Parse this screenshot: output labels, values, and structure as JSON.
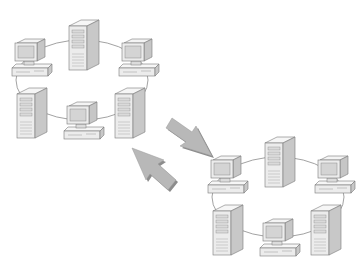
{
  "diagram": {
    "type": "network-ring-exchange",
    "colors": {
      "background": "#ffffff",
      "line": "#8a8a8a",
      "device_fill": "#ececec",
      "device_side": "#c8c8c8",
      "device_top": "#f6f6f6",
      "device_stroke": "#7a7a7a",
      "screen": "#d4d4d4",
      "arrow_fill": "#b8b8b8",
      "arrow_shadow": "#8c8c8c"
    },
    "networks": [
      {
        "id": "network-a",
        "position": "top-left",
        "offset": [
          0,
          0
        ],
        "topology": "ring",
        "nodes": [
          {
            "kind": "workstation",
            "slot": "top-left"
          },
          {
            "kind": "tower-server",
            "slot": "top-center"
          },
          {
            "kind": "workstation",
            "slot": "top-right"
          },
          {
            "kind": "tower-server",
            "slot": "bottom-left"
          },
          {
            "kind": "workstation",
            "slot": "bottom-center"
          },
          {
            "kind": "tower-server",
            "slot": "bottom-right"
          }
        ]
      },
      {
        "id": "network-b",
        "position": "bottom-right",
        "offset": [
          196,
          117
        ],
        "topology": "ring",
        "nodes": [
          {
            "kind": "workstation",
            "slot": "top-left"
          },
          {
            "kind": "tower-server",
            "slot": "top-center"
          },
          {
            "kind": "workstation",
            "slot": "top-right"
          },
          {
            "kind": "tower-server",
            "slot": "bottom-left"
          },
          {
            "kind": "workstation",
            "slot": "bottom-center"
          },
          {
            "kind": "tower-server",
            "slot": "bottom-right"
          }
        ]
      }
    ],
    "arrows": [
      {
        "direction": "down-right",
        "from": "network-a",
        "to": "network-b"
      },
      {
        "direction": "up-left",
        "from": "network-b",
        "to": "network-a"
      }
    ]
  }
}
